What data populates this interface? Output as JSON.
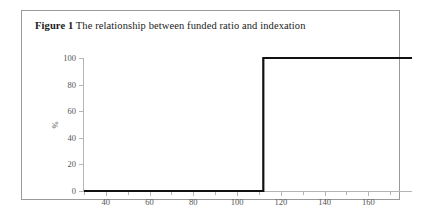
{
  "figure": {
    "label": "Figure 1",
    "caption": "The relationship between funded ratio and indexation"
  },
  "colors": {
    "line": "#111111",
    "axis": "#b5b5b5",
    "tick_text": "#555555",
    "border": "#9a9a9a",
    "background": "#ffffff"
  },
  "chart_data": {
    "type": "line",
    "title": "The relationship between funded ratio and indexation",
    "xlabel": "",
    "ylabel": "%",
    "xlim": [
      30,
      180
    ],
    "ylim": [
      0,
      100
    ],
    "grid": false,
    "legend": null,
    "x_ticks": [
      40,
      60,
      80,
      100,
      120,
      140,
      160
    ],
    "x_minor_ticks": [
      30,
      50,
      70,
      90,
      110,
      130,
      150,
      170
    ],
    "y_ticks": [
      0,
      20,
      40,
      60,
      80,
      100
    ],
    "series": [
      {
        "name": "Indexation",
        "step": "post",
        "x": [
          30,
          112,
          112,
          180
        ],
        "values": [
          0,
          0,
          100,
          100
        ]
      }
    ]
  }
}
